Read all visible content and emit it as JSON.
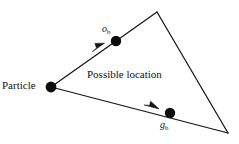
{
  "figure": {
    "background_color": "#ffffff",
    "stroke_color": "#141414",
    "width": 239,
    "height": 144,
    "labels": {
      "particle": "Particle",
      "region": "Possible location",
      "upper_vector_base": "o",
      "upper_vector_sub": "b",
      "lower_vector_base": "g",
      "lower_vector_sub": "b"
    },
    "geometry": {
      "vertices": {
        "particle": [
          51,
          87
        ],
        "apex": [
          157,
          12
        ],
        "right": [
          228,
          133
        ]
      },
      "dots": [
        {
          "name": "o-b-dot",
          "cx": 116,
          "cy": 41,
          "r": 5.2
        },
        {
          "name": "g-b-dot",
          "cx": 170,
          "cy": 113,
          "r": 5.2
        },
        {
          "name": "particle-dot",
          "cx": 51,
          "cy": 87,
          "r": 5.4
        }
      ],
      "arrowheads": [
        {
          "name": "upper-arrowhead",
          "x": 98,
          "y": 48
        },
        {
          "name": "lower-arrowhead",
          "x": 152,
          "y": 107
        }
      ]
    }
  }
}
